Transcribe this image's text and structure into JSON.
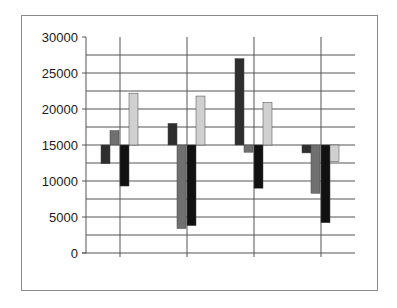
{
  "chart_data": {
    "type": "bar",
    "subtype": "floating-bar-from-baseline",
    "title": "",
    "xlabel": "",
    "ylabel": "",
    "baseline": 15000,
    "ylim": [
      0,
      30000
    ],
    "yticks": [
      0,
      5000,
      10000,
      15000,
      20000,
      25000,
      30000
    ],
    "ytick_labels": [
      "0",
      "5000",
      "10000",
      "15000",
      "20000",
      "25000",
      "30000"
    ],
    "minor_grid_step": 2500,
    "grid": true,
    "legend": null,
    "categories": [
      "",
      "",
      "",
      ""
    ],
    "series": [
      {
        "name": "Series 1",
        "color": "#2e2e2e",
        "values": [
          12400,
          18000,
          27000,
          13900
        ]
      },
      {
        "name": "Series 2",
        "color": "#707070",
        "values": [
          17000,
          3400,
          14000,
          8300
        ]
      },
      {
        "name": "Series 3",
        "color": "#111111",
        "values": [
          9300,
          3800,
          9000,
          4200
        ]
      },
      {
        "name": "Series 4",
        "color": "#d0d0d0",
        "values": [
          22200,
          21800,
          20900,
          12700
        ]
      }
    ]
  },
  "colors": {
    "frame": "#8a8a8a",
    "grid": "#555555",
    "axis": "#555555",
    "text": "#1a1a1a"
  }
}
